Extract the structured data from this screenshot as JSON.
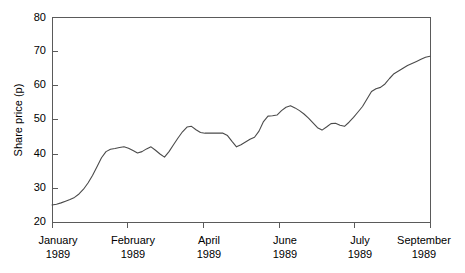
{
  "chart_data": {
    "type": "line",
    "title": "",
    "subtitle": "",
    "xlabel": "",
    "ylabel": "Share price (p)",
    "ylim": [
      20,
      80
    ],
    "yticks": [
      20,
      30,
      40,
      50,
      60,
      70,
      80
    ],
    "ytick_labels": [
      "20",
      "30",
      "40",
      "50",
      "60",
      "70",
      "80"
    ],
    "grid": false,
    "legend": false,
    "legend_position": "none",
    "frame": "full-box",
    "line_color": "#4a4a4a",
    "axis_color": "#5a5a5a",
    "background_color": "#ffffff",
    "xtick_labels": [
      {
        "month": "January",
        "year": "1989"
      },
      {
        "month": "February",
        "year": "1989"
      },
      {
        "month": "April",
        "year": "1989"
      },
      {
        "month": "June",
        "year": "1989"
      },
      {
        "month": "July",
        "year": "1989"
      },
      {
        "month": "September",
        "year": "1989"
      }
    ],
    "xtick_positions": [
      0,
      15,
      30,
      45,
      60,
      75
    ],
    "xlim": [
      0,
      75
    ],
    "series": [
      {
        "name": "Share price",
        "x": [
          0,
          1,
          2,
          3,
          4,
          5,
          6,
          7,
          8,
          9,
          10,
          11,
          12,
          13,
          14,
          15,
          16,
          17,
          18,
          19,
          20,
          21,
          22,
          23,
          24,
          25,
          26,
          27,
          28,
          29,
          30,
          31,
          32,
          33,
          34,
          35,
          36,
          37,
          38,
          39,
          40,
          41,
          42,
          43,
          44,
          45,
          46,
          47,
          48,
          49,
          50,
          51,
          52,
          53,
          54,
          55,
          56,
          57,
          58,
          59,
          60,
          61,
          62,
          63,
          64,
          65,
          66,
          67,
          68,
          69,
          70,
          71,
          72,
          73,
          74,
          75
        ],
        "values": [
          25.0,
          25.2,
          25.6,
          26.1,
          26.6,
          27.2,
          28.2,
          29.6,
          31.4,
          33.6,
          36.2,
          38.8,
          40.6,
          41.3,
          41.5,
          41.8,
          42.0,
          41.6,
          40.9,
          40.2,
          40.6,
          41.4,
          42.0,
          41.0,
          39.9,
          39.0,
          40.6,
          42.6,
          44.6,
          46.4,
          47.8,
          48.0,
          47.0,
          46.2,
          46.0,
          46.0,
          46.0,
          46.0,
          46.0,
          45.3,
          43.6,
          42.0,
          42.6,
          43.4,
          44.2,
          44.8,
          46.6,
          49.4,
          51.0,
          51.1,
          51.3,
          52.6,
          53.6,
          54.0,
          53.4,
          52.6,
          51.6,
          50.4,
          49.0,
          47.6,
          46.9,
          47.8,
          48.8,
          48.9,
          48.3,
          48.0,
          49.2,
          50.6,
          52.2,
          53.8,
          56.0,
          58.2,
          59.0,
          59.4,
          60.4,
          62.0
        ]
      }
    ],
    "series_extension": {
      "note": "continuation of the single series to the right frame edge",
      "x": [
        76,
        77,
        78,
        79,
        80,
        81,
        82,
        83,
        84
      ],
      "values": [
        63.4,
        64.2,
        65.0,
        65.8,
        66.4,
        67.0,
        67.6,
        68.2,
        68.5
      ]
    }
  },
  "figure": {
    "axis_title_y": "Share price (p)"
  }
}
